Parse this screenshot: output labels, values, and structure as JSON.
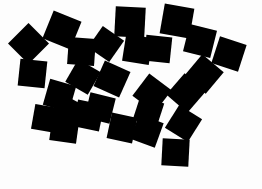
{
  "image": {
    "title": "Scattered black squares on white background",
    "width": 262,
    "height": 189,
    "background_color": "#fdfdfd",
    "shape_color": "#000000",
    "shape_kind": "square",
    "shape_count": 27,
    "description": "Randomly rotated solid black squares clustered in an arch / mound arrangement over the upper two thirds of a white field, leaving the lower left and lower right corners empty."
  },
  "chart_data": {
    "type": "scatter",
    "xlabel": "",
    "ylabel": "",
    "xlim": [
      0,
      262
    ],
    "ylim": [
      0,
      189
    ],
    "grid": false,
    "legend": null,
    "marker": "square",
    "marker_color": "#000000",
    "background": "#fdfdfd",
    "note": "x,y are the pixel centers of each square; size is the square edge length in pixels; rot is the clockwise rotation in degrees.",
    "squares": [
      {
        "id": 1,
        "x": 28,
        "y": 43,
        "size": 29,
        "rot": 45
      },
      {
        "id": 2,
        "x": 62,
        "y": 30,
        "size": 30,
        "rot": 22
      },
      {
        "id": 3,
        "x": 32,
        "y": 73,
        "size": 27,
        "rot": 6
      },
      {
        "id": 4,
        "x": 59,
        "y": 95,
        "size": 27,
        "rot": 16
      },
      {
        "id": 5,
        "x": 81,
        "y": 51,
        "size": 27,
        "rot": 4
      },
      {
        "id": 6,
        "x": 88,
        "y": 115,
        "size": 27,
        "rot": 12
      },
      {
        "id": 7,
        "x": 64,
        "y": 128,
        "size": 27,
        "rot": 8
      },
      {
        "id": 8,
        "x": 83,
        "y": 77,
        "size": 26,
        "rot": 30
      },
      {
        "id": 9,
        "x": 106,
        "y": 44,
        "size": 26,
        "rot": 35
      },
      {
        "id": 10,
        "x": 112,
        "y": 79,
        "size": 28,
        "rot": 24
      },
      {
        "id": 11,
        "x": 100,
        "y": 108,
        "size": 26,
        "rot": 14
      },
      {
        "id": 12,
        "x": 130,
        "y": 22,
        "size": 30,
        "rot": 3
      },
      {
        "id": 13,
        "x": 137,
        "y": 49,
        "size": 27,
        "rot": 9
      },
      {
        "id": 14,
        "x": 122,
        "y": 128,
        "size": 26,
        "rot": 12
      },
      {
        "id": 15,
        "x": 147,
        "y": 131,
        "size": 26,
        "rot": 20
      },
      {
        "id": 16,
        "x": 152,
        "y": 93,
        "size": 28,
        "rot": 37
      },
      {
        "id": 17,
        "x": 158,
        "y": 49,
        "size": 26,
        "rot": 6
      },
      {
        "id": 18,
        "x": 177,
        "y": 21,
        "size": 30,
        "rot": 10
      },
      {
        "id": 19,
        "x": 175,
        "y": 152,
        "size": 27,
        "rot": 3
      },
      {
        "id": 20,
        "x": 183,
        "y": 123,
        "size": 27,
        "rot": 32
      },
      {
        "id": 21,
        "x": 186,
        "y": 93,
        "size": 28,
        "rot": 41
      },
      {
        "id": 22,
        "x": 200,
        "y": 41,
        "size": 28,
        "rot": 14
      },
      {
        "id": 23,
        "x": 204,
        "y": 74,
        "size": 28,
        "rot": 40
      },
      {
        "id": 24,
        "x": 229,
        "y": 54,
        "size": 28,
        "rot": 18
      },
      {
        "id": 25,
        "x": 148,
        "y": 111,
        "size": 25,
        "rot": 18
      },
      {
        "id": 26,
        "x": 70,
        "y": 112,
        "size": 25,
        "rot": 28
      },
      {
        "id": 27,
        "x": 45,
        "y": 118,
        "size": 25,
        "rot": 10
      }
    ]
  }
}
